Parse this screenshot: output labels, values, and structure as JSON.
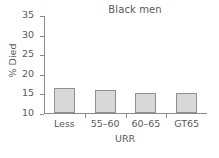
{
  "chart_data": {
    "type": "bar",
    "title": "Black men",
    "xlabel": "URR",
    "ylabel": "% Died",
    "categories": [
      "Less",
      "55–60",
      "60–65",
      "GT65"
    ],
    "values": [
      16.5,
      15.8,
      15.0,
      15.2
    ],
    "ylim": [
      10,
      35
    ],
    "yticks": [
      10,
      15,
      20,
      25,
      30,
      35
    ],
    "ytick_labels": [
      "10",
      "15",
      "20",
      "25",
      "30",
      "35"
    ],
    "grid": false,
    "legend": null,
    "series": [
      {
        "name": "% Died",
        "values": [
          16.5,
          15.8,
          15.0,
          15.2
        ]
      }
    ],
    "colors": {
      "bar_fill": "#d8d8d8",
      "bar_edge": "#8f8f91",
      "axis": "#8a8a8c",
      "text": "#58585a",
      "background": "#ffffff"
    }
  }
}
